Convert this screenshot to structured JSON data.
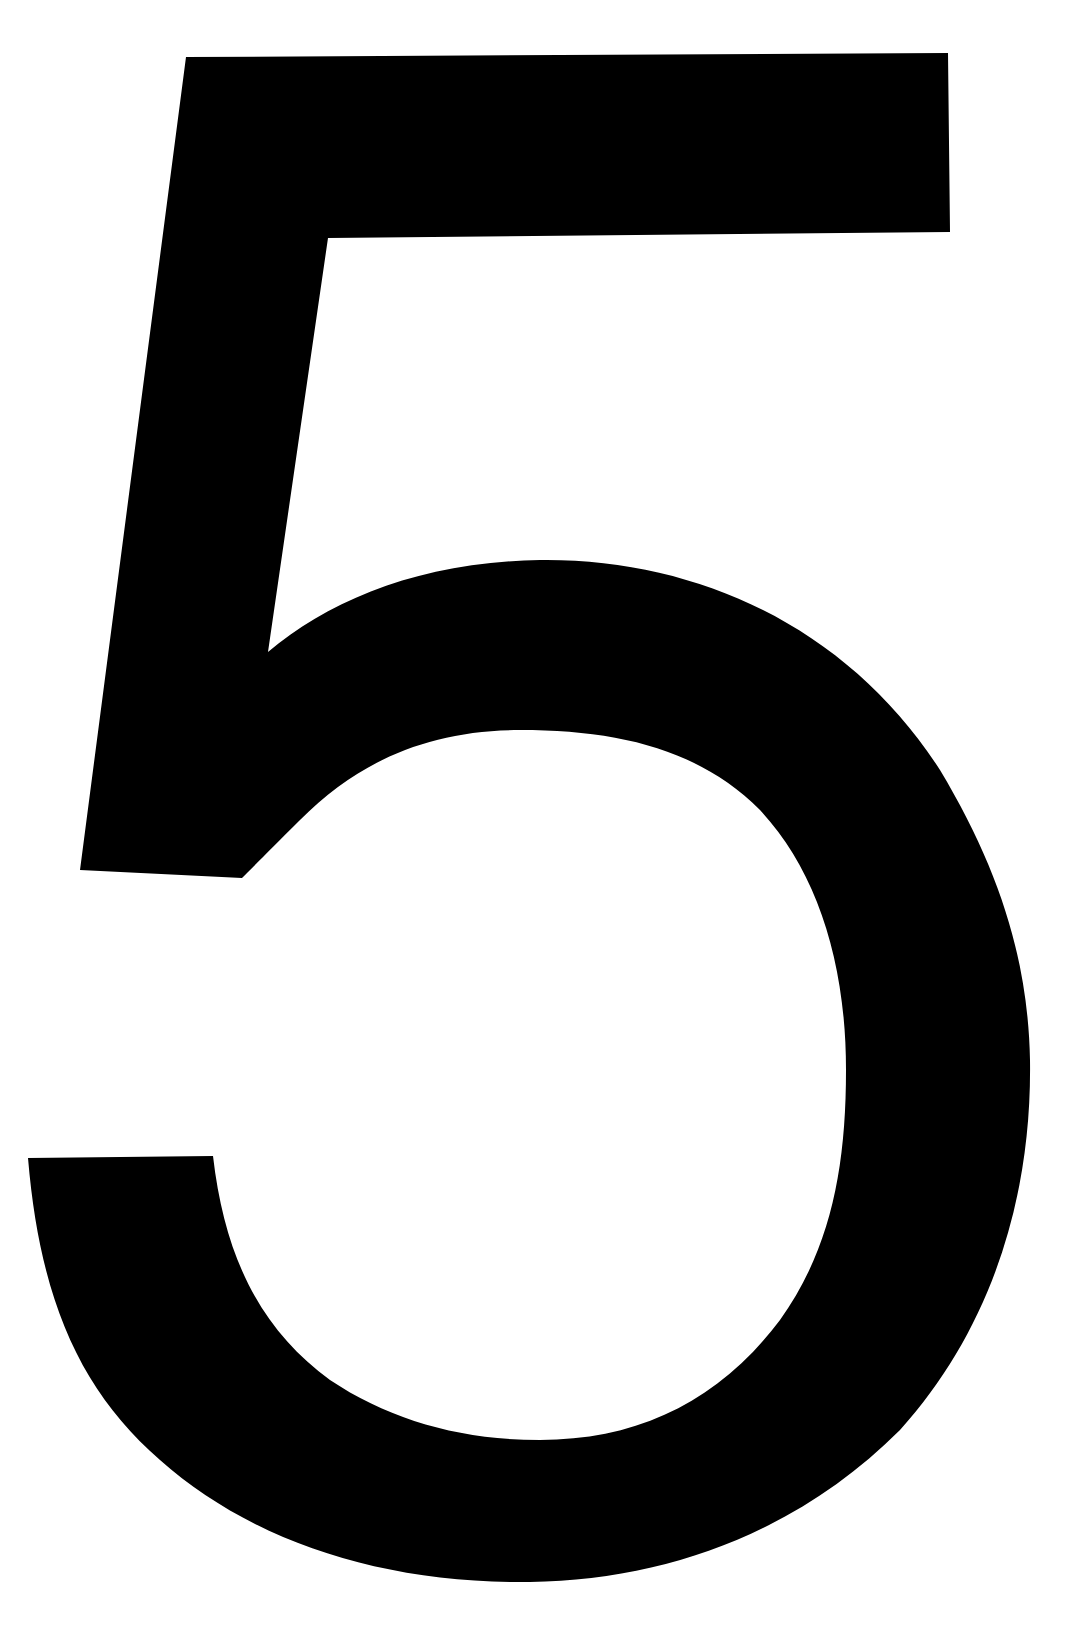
{
  "glyph": {
    "character": "5",
    "fill_color": "#000000",
    "background_color": "#ffffff"
  }
}
